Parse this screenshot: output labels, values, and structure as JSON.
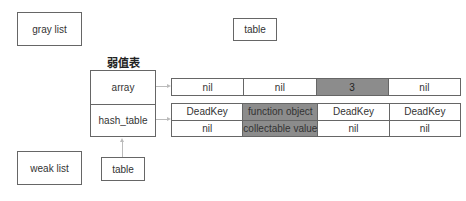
{
  "nodes": {
    "gray_list": "gray list",
    "weak_list": "weak list",
    "table_top": "table",
    "table_bottom": "table",
    "weak_value_table_title": "弱值表"
  },
  "table_struct": {
    "array_label": "array",
    "hash_label": "hash_table"
  },
  "array_part": {
    "cells": [
      {
        "value": "nil",
        "highlighted": false
      },
      {
        "value": "nil",
        "highlighted": false
      },
      {
        "value": "3",
        "highlighted": true
      },
      {
        "value": "nil",
        "highlighted": false
      }
    ]
  },
  "hash_part": {
    "entries": [
      {
        "key": "DeadKey",
        "value": "nil",
        "highlighted": false
      },
      {
        "key": "function object",
        "value": "collectable value",
        "highlighted": true
      },
      {
        "key": "DeadKey",
        "value": "nil",
        "highlighted": false
      },
      {
        "key": "DeadKey",
        "value": "nil",
        "highlighted": false
      }
    ]
  },
  "colors": {
    "highlight": "#8c8c8c",
    "border": "#666666",
    "arrow": "#bbbbbb"
  }
}
